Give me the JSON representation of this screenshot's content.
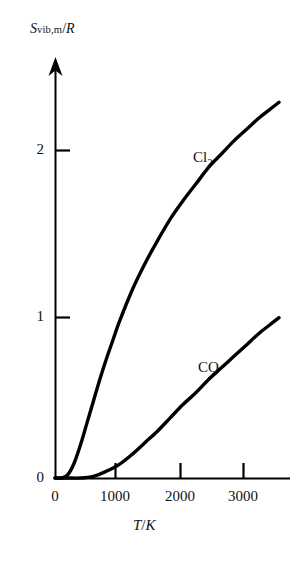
{
  "chart_data": {
    "type": "line",
    "title": "",
    "subtitle": "",
    "xlabel": "T/K",
    "ylabel": "Svib,m/R",
    "ylabel_parts": {
      "main": "S",
      "sub": "vib,m",
      "slash": "/",
      "denominator": "R"
    },
    "xlabel_parts": {
      "numerator": "T",
      "slash": "/",
      "denominator": "K"
    },
    "xlim": [
      0,
      3500
    ],
    "ylim": [
      0,
      2.6
    ],
    "grid": false,
    "legend_position": "inline-annotation",
    "x_ticks": [
      {
        "value": 0,
        "label": "0"
      },
      {
        "value": 1000,
        "label": "1000"
      },
      {
        "value": 2000,
        "label": "2000"
      },
      {
        "value": 3000,
        "label": "3000"
      }
    ],
    "y_ticks": [
      {
        "value": 0,
        "label": "0"
      },
      {
        "value": 1,
        "label": "1"
      },
      {
        "value": 2,
        "label": "2"
      }
    ],
    "axis_style": {
      "x_axis": "plain-line",
      "y_axis": "arrow-head",
      "color": "#000000"
    },
    "series": [
      {
        "name": "Cl2",
        "annotation": "Cl₂",
        "annotation_main": "Cl",
        "annotation_sub": "2",
        "color": "#000000",
        "line_width": 3,
        "x": [
          0,
          100,
          200,
          300,
          400,
          500,
          600,
          700,
          800,
          900,
          1000,
          1200,
          1400,
          1600,
          1800,
          2000,
          2200,
          2400,
          2600,
          2800,
          3000,
          3200,
          3400,
          3500
        ],
        "y": [
          0.0,
          0.0,
          0.02,
          0.09,
          0.2,
          0.33,
          0.46,
          0.59,
          0.71,
          0.82,
          0.93,
          1.12,
          1.28,
          1.42,
          1.55,
          1.66,
          1.76,
          1.86,
          1.94,
          2.02,
          2.09,
          2.16,
          2.22,
          2.25
        ]
      },
      {
        "name": "CO",
        "annotation": "CO",
        "annotation_main": "CO",
        "annotation_sub": "",
        "color": "#000000",
        "line_width": 3,
        "x": [
          0,
          200,
          400,
          600,
          800,
          1000,
          1200,
          1400,
          1600,
          1800,
          2000,
          2200,
          2400,
          2600,
          2800,
          3000,
          3200,
          3400,
          3500
        ],
        "y": [
          0.0,
          0.0,
          0.0,
          0.01,
          0.04,
          0.08,
          0.14,
          0.21,
          0.28,
          0.36,
          0.44,
          0.51,
          0.59,
          0.66,
          0.73,
          0.8,
          0.87,
          0.93,
          0.96
        ]
      }
    ]
  },
  "geometry": {
    "origin_x": 55,
    "origin_y": 478,
    "x_per_1000K": 64,
    "y_per_unit": 167,
    "axis_top_y": 58,
    "axis_right_x": 292
  }
}
